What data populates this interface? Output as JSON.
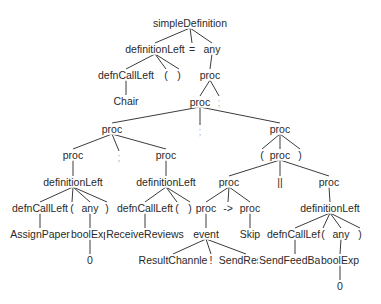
{
  "diagram": {
    "type": "parse-tree",
    "root": "simpleDefinition",
    "nodes": [
      {
        "id": "n0",
        "label": "simpleDefinition",
        "x": 190,
        "y": 23
      },
      {
        "id": "n1",
        "label": "definitionLeft",
        "x": 155,
        "y": 49
      },
      {
        "id": "n2",
        "label": "=",
        "x": 192,
        "y": 49
      },
      {
        "id": "n3",
        "label": "any",
        "x": 212,
        "y": 49
      },
      {
        "id": "n4",
        "label": "defnCallLeft",
        "x": 126,
        "y": 75
      },
      {
        "id": "n5",
        "label": "(",
        "x": 166,
        "y": 75
      },
      {
        "id": "n6",
        "label": ")",
        "x": 179,
        "y": 75
      },
      {
        "id": "n7",
        "label": "proc",
        "x": 210,
        "y": 75
      },
      {
        "id": "n8",
        "label": "Chair",
        "x": 126,
        "y": 101
      },
      {
        "id": "n9",
        "label": "proc",
        "x": 200,
        "y": 102
      },
      {
        "id": "n10",
        "label": ";",
        "x": 219,
        "y": 102,
        "faint": true
      },
      {
        "id": "n11",
        "label": "proc",
        "x": 112,
        "y": 129
      },
      {
        "id": "n12",
        "label": ";",
        "x": 200,
        "y": 131,
        "faint": true
      },
      {
        "id": "n13",
        "label": "proc",
        "x": 280,
        "y": 129
      },
      {
        "id": "n14",
        "label": "proc",
        "x": 73,
        "y": 155
      },
      {
        "id": "n15",
        "label": ";",
        "x": 119,
        "y": 157,
        "faint": true
      },
      {
        "id": "n16",
        "label": "proc",
        "x": 166,
        "y": 155
      },
      {
        "id": "n17",
        "label": "(",
        "x": 262,
        "y": 155
      },
      {
        "id": "n18",
        "label": "proc",
        "x": 280,
        "y": 155
      },
      {
        "id": "n19",
        "label": ")",
        "x": 300,
        "y": 155
      },
      {
        "id": "n20",
        "label": "definitionLeft",
        "x": 73,
        "y": 182
      },
      {
        "id": "n21",
        "label": "definitionLeft",
        "x": 166,
        "y": 182
      },
      {
        "id": "n22",
        "label": "proc",
        "x": 229,
        "y": 182
      },
      {
        "id": "n23",
        "label": "||",
        "x": 280,
        "y": 182
      },
      {
        "id": "n24",
        "label": "proc",
        "x": 329,
        "y": 182
      },
      {
        "id": "n25",
        "label": "defnCallLeft",
        "x": 40,
        "y": 208
      },
      {
        "id": "n26",
        "label": "(",
        "x": 72,
        "y": 208
      },
      {
        "id": "n27",
        "label": "any",
        "x": 90,
        "y": 208
      },
      {
        "id": "n28",
        "label": ")",
        "x": 107,
        "y": 208
      },
      {
        "id": "n29",
        "label": "defnCallLeft",
        "x": 145,
        "y": 208
      },
      {
        "id": "n30",
        "label": "(",
        "x": 177,
        "y": 208
      },
      {
        "id": "n31",
        "label": ")",
        "x": 190,
        "y": 208
      },
      {
        "id": "n32",
        "label": "proc",
        "x": 206,
        "y": 208
      },
      {
        "id": "n33",
        "label": "->",
        "x": 228,
        "y": 208
      },
      {
        "id": "n34",
        "label": "proc",
        "x": 250,
        "y": 208
      },
      {
        "id": "n35",
        "label": "definitionLeft",
        "x": 330,
        "y": 208
      },
      {
        "id": "n36",
        "label": "AssignPaper",
        "x": 40,
        "y": 234
      },
      {
        "id": "n37",
        "label": "boolExp",
        "x": 90,
        "y": 234
      },
      {
        "id": "n38",
        "label": "ReceiveReviews",
        "x": 145,
        "y": 234
      },
      {
        "id": "n39",
        "label": "event",
        "x": 206,
        "y": 234
      },
      {
        "id": "n40",
        "label": "Skip",
        "x": 250,
        "y": 234
      },
      {
        "id": "n41",
        "label": "defnCallLeft",
        "x": 295,
        "y": 234
      },
      {
        "id": "n42",
        "label": "(",
        "x": 323,
        "y": 234
      },
      {
        "id": "n43",
        "label": "any",
        "x": 341,
        "y": 234
      },
      {
        "id": "n44",
        "label": ")",
        "x": 360,
        "y": 234
      },
      {
        "id": "n45",
        "label": "0",
        "x": 90,
        "y": 260
      },
      {
        "id": "n46",
        "label": "ResultChannle",
        "x": 173,
        "y": 260
      },
      {
        "id": "n47",
        "label": "!",
        "x": 211,
        "y": 260
      },
      {
        "id": "n48",
        "label": "SendResult",
        "x": 246,
        "y": 260
      },
      {
        "id": "n49",
        "label": "SendFeedBack",
        "x": 295,
        "y": 260
      },
      {
        "id": "n50",
        "label": "boolExp",
        "x": 340,
        "y": 260
      },
      {
        "id": "n51",
        "label": "0",
        "x": 340,
        "y": 286
      }
    ],
    "edges": [
      [
        "n0",
        "n1"
      ],
      [
        "n0",
        "n2"
      ],
      [
        "n0",
        "n3"
      ],
      [
        "n1",
        "n4"
      ],
      [
        "n1",
        "n5"
      ],
      [
        "n1",
        "n6"
      ],
      [
        "n3",
        "n7"
      ],
      [
        "n4",
        "n8"
      ],
      [
        "n7",
        "n9"
      ],
      [
        "n7",
        "n10"
      ],
      [
        "n9",
        "n11"
      ],
      [
        "n9",
        "n12"
      ],
      [
        "n9",
        "n13"
      ],
      [
        "n11",
        "n14"
      ],
      [
        "n11",
        "n15"
      ],
      [
        "n11",
        "n16"
      ],
      [
        "n13",
        "n17"
      ],
      [
        "n13",
        "n18"
      ],
      [
        "n13",
        "n19"
      ],
      [
        "n14",
        "n20"
      ],
      [
        "n16",
        "n21"
      ],
      [
        "n18",
        "n22"
      ],
      [
        "n18",
        "n23"
      ],
      [
        "n18",
        "n24"
      ],
      [
        "n20",
        "n25"
      ],
      [
        "n20",
        "n26"
      ],
      [
        "n20",
        "n27"
      ],
      [
        "n20",
        "n28"
      ],
      [
        "n21",
        "n29"
      ],
      [
        "n21",
        "n30"
      ],
      [
        "n21",
        "n31"
      ],
      [
        "n22",
        "n32"
      ],
      [
        "n22",
        "n33"
      ],
      [
        "n22",
        "n34"
      ],
      [
        "n24",
        "n35"
      ],
      [
        "n25",
        "n36"
      ],
      [
        "n27",
        "n37"
      ],
      [
        "n29",
        "n38"
      ],
      [
        "n32",
        "n39"
      ],
      [
        "n34",
        "n40"
      ],
      [
        "n35",
        "n41"
      ],
      [
        "n35",
        "n42"
      ],
      [
        "n35",
        "n43"
      ],
      [
        "n35",
        "n44"
      ],
      [
        "n37",
        "n45"
      ],
      [
        "n39",
        "n46"
      ],
      [
        "n39",
        "n47"
      ],
      [
        "n39",
        "n48"
      ],
      [
        "n41",
        "n49"
      ],
      [
        "n43",
        "n50"
      ],
      [
        "n50",
        "n51"
      ]
    ],
    "colors": {
      "edge": "#3c3c3c",
      "text": "#2a2a2a",
      "faint": "#b5b5b5",
      "background": "#ffffff"
    }
  }
}
